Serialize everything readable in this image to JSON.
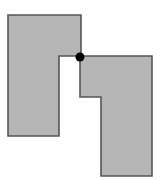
{
  "diagram": {
    "colors": {
      "background": "#fefefe",
      "fill": "#b5b5b5",
      "stroke": "#555555",
      "joint": "#000000"
    },
    "shapes": [
      {
        "id": "left-polygon",
        "points": "8,15 81,15 81,56 59,56 59,136 8,136"
      },
      {
        "id": "right-polygon",
        "points": "80,56 152,56 152,176 101,176 101,97 80,97"
      }
    ],
    "joint_point": {
      "cx": 80,
      "cy": 57,
      "r": 4.5
    }
  }
}
